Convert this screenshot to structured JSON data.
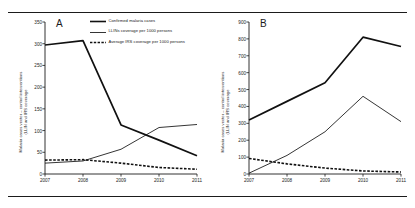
{
  "figure": {
    "panels": [
      {
        "letter": "A",
        "ylabel": "Malaria cases vector – control interventions\n(LLIN and IRS coverage",
        "ylim": [
          0,
          350
        ],
        "yticks": [
          0,
          50,
          100,
          150,
          200,
          250,
          300,
          350
        ],
        "xticks": [
          "2007",
          "2008",
          "2009",
          "2010",
          "2011"
        ]
      },
      {
        "letter": "B",
        "ylabel": "Malaria cases vector – control interventions\n(LLIN and IRS coverage",
        "ylim": [
          0,
          900
        ],
        "yticks": [
          0,
          100,
          200,
          300,
          400,
          500,
          600,
          700,
          800,
          900
        ],
        "xticks": [
          "2007",
          "2008",
          "2009",
          "2010",
          "2011"
        ]
      }
    ],
    "legend": [
      {
        "label": "Confirmed malaria cases",
        "style": "solid-thick",
        "color": "#111111"
      },
      {
        "label": "LLINs coverage per 1000 persons",
        "style": "solid-thin",
        "color": "#111111"
      },
      {
        "label": "Average IRS coverage per 1000 persons",
        "style": "dashed",
        "color": "#111111"
      }
    ]
  },
  "chart_data": [
    {
      "type": "line",
      "title": "A",
      "xlabel": "",
      "ylabel": "Malaria cases vector – control interventions (LLIN and IRS coverage",
      "x": [
        "2007",
        "2008",
        "2009",
        "2010",
        "2011"
      ],
      "ylim": [
        0,
        350
      ],
      "yticks": [
        0,
        50,
        100,
        150,
        200,
        250,
        300,
        350
      ],
      "grid": false,
      "legend_position": "top-right",
      "series": [
        {
          "name": "Confirmed malaria cases",
          "values": [
            297,
            307,
            113,
            78,
            42
          ],
          "style": "solid-thick"
        },
        {
          "name": "LLINs coverage per 1000 persons",
          "values": [
            25,
            30,
            57,
            107,
            114
          ],
          "style": "solid-thin"
        },
        {
          "name": "Average IRS coverage per 1000 persons",
          "values": [
            32,
            33,
            25,
            15,
            11
          ],
          "style": "dashed"
        }
      ]
    },
    {
      "type": "line",
      "title": "B",
      "xlabel": "",
      "ylabel": "Malaria cases vector – control interventions (LLIN and IRS coverage",
      "x": [
        "2007",
        "2008",
        "2009",
        "2010",
        "2011"
      ],
      "ylim": [
        0,
        900
      ],
      "yticks": [
        0,
        100,
        200,
        300,
        400,
        500,
        600,
        700,
        800,
        900
      ],
      "grid": false,
      "legend_position": "none",
      "series": [
        {
          "name": "Confirmed malaria cases",
          "values": [
            320,
            430,
            540,
            810,
            755
          ],
          "style": "solid-thick"
        },
        {
          "name": "LLINs coverage per 1000 persons",
          "values": [
            5,
            110,
            250,
            460,
            310
          ],
          "style": "solid-thin"
        },
        {
          "name": "Average IRS coverage per 1000 persons",
          "values": [
            92,
            60,
            35,
            18,
            12
          ],
          "style": "dashed"
        }
      ]
    }
  ]
}
